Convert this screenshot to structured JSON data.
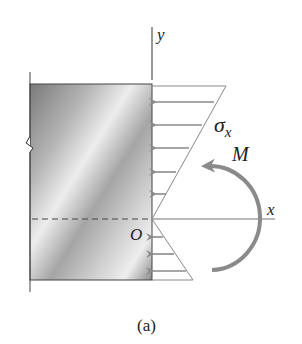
{
  "figure": {
    "caption": "(a)",
    "labels": {
      "y_axis": "y",
      "x_axis": "x",
      "origin": "O",
      "stress": "σ",
      "stress_subscript": "x",
      "moment": "M"
    },
    "colors": {
      "block_dark": "#6e6e6e",
      "block_light": "#e6e6e6",
      "arrow_gray": "#8a8a8a",
      "axis": "#555555",
      "outline": "#444444"
    },
    "stress_distribution": {
      "top": "compression (arrows pointing left)",
      "bottom": "tension (arrows pointing right)",
      "compression_arrow_count": 6,
      "tension_arrow_count": 3
    }
  }
}
